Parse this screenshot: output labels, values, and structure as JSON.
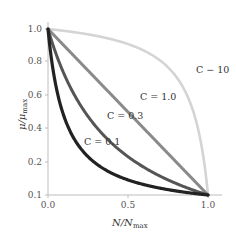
{
  "chart_data": {
    "type": "line",
    "title": "",
    "xlabel": "N/N_max",
    "ylabel": "μ/μ_max",
    "xlim": [
      0.0,
      1.0
    ],
    "ylim": [
      0.0,
      1.0
    ],
    "grid": false,
    "legend": "inline labels",
    "x_ticks": [
      "0.0",
      "0.5",
      "1.0"
    ],
    "y_ticks": [
      "0.1",
      "0.2",
      "0.4",
      "0.6",
      "0.8",
      "1.0"
    ],
    "x": [
      0.0,
      0.05,
      0.1,
      0.15,
      0.2,
      0.25,
      0.3,
      0.35,
      0.4,
      0.45,
      0.5,
      0.55,
      0.6,
      0.65,
      0.7,
      0.75,
      0.8,
      0.85,
      0.9,
      0.95,
      1.0
    ],
    "series": [
      {
        "name": "C = 0.1",
        "color": "#222222",
        "values": [
          1.0,
          0.655,
          0.474,
          0.362,
          0.286,
          0.231,
          0.189,
          0.157,
          0.13,
          0.109,
          0.091,
          0.076,
          0.063,
          0.051,
          0.041,
          0.032,
          0.024,
          0.017,
          0.011,
          0.005,
          0.0
        ]
      },
      {
        "name": "C = 0.3",
        "color": "#555555",
        "values": [
          1.0,
          0.851,
          0.73,
          0.638,
          0.545,
          0.474,
          0.412,
          0.357,
          0.31,
          0.268,
          0.231,
          0.197,
          0.167,
          0.14,
          0.114,
          0.091,
          0.07,
          0.05,
          0.032,
          0.016,
          0.0
        ]
      },
      {
        "name": "C = 1.0",
        "color": "#8a8a8a",
        "values": [
          1.0,
          0.95,
          0.9,
          0.85,
          0.8,
          0.75,
          0.7,
          0.65,
          0.6,
          0.55,
          0.5,
          0.45,
          0.4,
          0.35,
          0.3,
          0.25,
          0.2,
          0.15,
          0.1,
          0.05,
          0.0
        ]
      },
      {
        "name": "C = 10",
        "color": "#d4d4d4",
        "values": [
          1.0,
          0.995,
          0.989,
          0.983,
          0.976,
          0.968,
          0.959,
          0.949,
          0.938,
          0.924,
          0.909,
          0.891,
          0.87,
          0.843,
          0.811,
          0.769,
          0.714,
          0.639,
          0.526,
          0.345,
          0.0
        ]
      }
    ]
  },
  "labels": {
    "c01": "C = 0.1",
    "c03": "C = 0.3",
    "c10": "C = 1.0",
    "c100": "C − 10",
    "xlabel_main": "N/N",
    "xlabel_sub": "max",
    "ylabel_main": "μ/μ",
    "ylabel_sub": "max"
  }
}
